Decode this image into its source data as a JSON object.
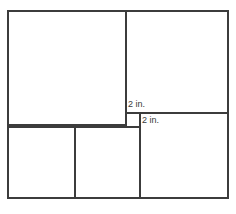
{
  "figure": {
    "stroke_color": "#3c3c3c",
    "fill_color": "#ffffff",
    "stroke_width": 2,
    "outer_rectangle": {
      "x": 8,
      "y": 11,
      "width": 220,
      "height": 187
    },
    "labels": [
      {
        "id": "small-square-width",
        "text": "2 in.",
        "x": 127,
        "y": 99
      },
      {
        "id": "small-square-height",
        "text": "2 in.",
        "x": 141,
        "y": 115
      }
    ],
    "regions": [
      {
        "id": "top-left-square",
        "name": "top-left-square",
        "x": 8,
        "y": 11,
        "width": 118,
        "height": 114
      },
      {
        "id": "top-right-square",
        "name": "top-right-square",
        "x": 126,
        "y": 11,
        "width": 102,
        "height": 102
      },
      {
        "id": "small-square",
        "name": "small-square",
        "x": 126,
        "y": 113,
        "width": 14,
        "height": 14
      },
      {
        "id": "right-rectangle",
        "name": "right-rectangle",
        "x": 140,
        "y": 113,
        "width": 88,
        "height": 85
      },
      {
        "id": "bottom-left-square",
        "name": "bottom-left-square",
        "x": 8,
        "y": 127,
        "width": 67,
        "height": 71
      },
      {
        "id": "bottom-mid-square",
        "name": "bottom-mid-square",
        "x": 75,
        "y": 127,
        "width": 65,
        "height": 71
      }
    ],
    "segments": [
      {
        "id": "outer-top",
        "x1": 8,
        "y1": 11,
        "x2": 228,
        "y2": 11
      },
      {
        "id": "outer-right",
        "x1": 228,
        "y1": 11,
        "x2": 228,
        "y2": 198
      },
      {
        "id": "outer-bottom",
        "x1": 8,
        "y1": 198,
        "x2": 228,
        "y2": 198
      },
      {
        "id": "outer-left",
        "x1": 8,
        "y1": 11,
        "x2": 8,
        "y2": 198
      },
      {
        "id": "main-vertical",
        "x1": 126,
        "y1": 11,
        "x2": 126,
        "y2": 127
      },
      {
        "id": "top-right-bottom",
        "x1": 126,
        "y1": 113,
        "x2": 228,
        "y2": 113
      },
      {
        "id": "small-square-right",
        "x1": 140,
        "y1": 113,
        "x2": 140,
        "y2": 198
      },
      {
        "id": "top-left-bottom",
        "x1": 8,
        "y1": 125,
        "x2": 126,
        "y2": 125
      },
      {
        "id": "bottom-row-top",
        "x1": 8,
        "y1": 127,
        "x2": 140,
        "y2": 127
      },
      {
        "id": "bottom-divider",
        "x1": 75,
        "y1": 127,
        "x2": 75,
        "y2": 198
      }
    ]
  }
}
